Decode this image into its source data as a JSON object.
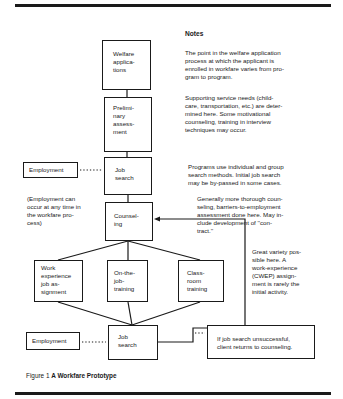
{
  "figure": {
    "caption_number": "Figure 1",
    "caption_title": "A Workfare Prototype"
  },
  "flow": {
    "welfare_applications": "Welfare\napplica-\ntions",
    "preliminary_assessment": "Prelimi-\nnary\nassess-\nment",
    "job_search_1": "Job\nsearch",
    "employment_1": "Employment",
    "counseling": "Counsel-\ning",
    "work_experience": "Work\nexperience\njob as-\nsignment",
    "on_the_job_training": "On-the-\njob-\ntraining",
    "classroom_training": "Class-\nroom\ntraining",
    "job_search_2": "Job\nsearch",
    "employment_2": "Employment",
    "employment_anytime_note": "(Employment can\noccur at any time in\nthe workfare pro-\ncess)",
    "unsuccessful_note": "If job search unsuccessful,\nclient returns to counseling."
  },
  "notes": {
    "heading": "Notes",
    "items": [
      "The point in the welfare application\nprocess at which the applicant is\nenrolled in workfare varies from pro-\ngram to program.",
      "Supporting service needs (child-\ncare, transportation, etc.) are deter-\nmined here. Some motivational\ncounseling, training in interview\ntechniques may occur.",
      "Programs use individual and group\nsearch methods. Initial job search\nmay be by-passed in some cases.",
      "Generally more thorough coun-\nseling, barriers-to-employment\nassessment done here. May in-\nclude development of ''con-\ntract.''",
      "Great variety pos-\nsible here. A\nwork-experience\n(CWEP) assign-\nment is rarely the\ninitial activity."
    ]
  }
}
